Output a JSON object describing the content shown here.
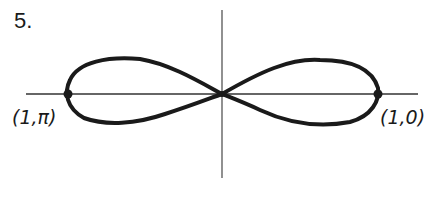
{
  "problem": {
    "number": "5."
  },
  "axes": {
    "origin": [
      222,
      94
    ],
    "x_axis": {
      "from": 26,
      "to": 418
    },
    "y_axis": {
      "from": 10,
      "to": 178
    }
  },
  "curve": {
    "type": "lemniscate (figure-eight polar curve)",
    "stroke_color": "#1a1a1a"
  },
  "points": [
    {
      "label": "(1,0)",
      "x": 378,
      "y": 94
    },
    {
      "label": "(1,π)",
      "x": 68,
      "y": 94
    }
  ]
}
